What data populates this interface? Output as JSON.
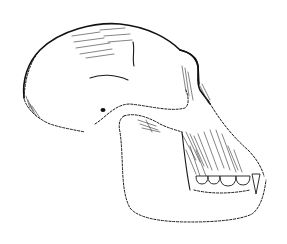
{
  "image": {
    "subject": "Line drawing of a primate skull in lateral view",
    "width": 287,
    "height": 244,
    "background": "#ffffff",
    "ink": "#1a1a1a"
  }
}
